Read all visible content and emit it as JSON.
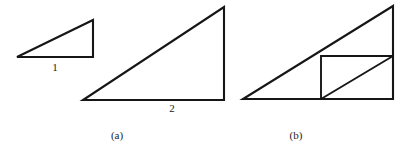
{
  "figure": {
    "width": 408,
    "height": 149,
    "background_color": "#ffffff",
    "stroke_color": "#161616",
    "panels": [
      {
        "id": "panel-a",
        "caption": "(a)",
        "caption_position": {
          "x": 117,
          "y": 135
        },
        "shapes": [
          {
            "id": "small-triangle",
            "type": "right-triangle",
            "points": "17,57 93,57 93,20",
            "description": "small right triangle, base labelled 1"
          },
          {
            "id": "large-triangle",
            "type": "right-triangle",
            "points": "83,100 224,100 224,7",
            "description": "large similar right triangle, base labelled 2"
          }
        ],
        "labels": [
          {
            "id": "label-base-1",
            "text": "1",
            "x": 55,
            "y": 67
          },
          {
            "id": "label-base-2",
            "text": "2",
            "x": 172,
            "y": 108
          }
        ]
      },
      {
        "id": "panel-b",
        "caption": "(b)",
        "caption_position": {
          "x": 296,
          "y": 135
        },
        "shapes": [
          {
            "id": "outer-triangle",
            "type": "right-triangle",
            "points": "243,99 393,99 393,6",
            "description": "large right triangle with inscribed rectangle"
          },
          {
            "id": "inscribed-rectangle",
            "type": "rectangle",
            "points": "321,56 393,56 393,99 321,99",
            "description": "rectangle inscribed in right half of the triangle"
          },
          {
            "id": "rectangle-diagonal",
            "type": "segment",
            "points": "321,99 393,56",
            "description": "diagonal of the inscribed rectangle"
          }
        ],
        "labels": []
      }
    ]
  },
  "chart_data": {
    "type": "diagram",
    "title": "",
    "panels": [
      {
        "caption": "(a)",
        "elements": [
          {
            "name": "small right triangle",
            "base_label": "1",
            "vertices": [
              [
                17,
                57
              ],
              [
                93,
                57
              ],
              [
                93,
                20
              ]
            ]
          },
          {
            "name": "large right triangle",
            "base_label": "2",
            "vertices": [
              [
                83,
                100
              ],
              [
                224,
                100
              ],
              [
                224,
                7
              ]
            ]
          }
        ]
      },
      {
        "caption": "(b)",
        "elements": [
          {
            "name": "outer right triangle",
            "base_label": "",
            "vertices": [
              [
                243,
                99
              ],
              [
                393,
                99
              ],
              [
                393,
                6
              ]
            ]
          },
          {
            "name": "inscribed rectangle",
            "base_label": "",
            "vertices": [
              [
                321,
                56
              ],
              [
                393,
                56
              ],
              [
                393,
                99
              ],
              [
                321,
                99
              ]
            ]
          },
          {
            "name": "rectangle diagonal",
            "base_label": "",
            "vertices": [
              [
                321,
                99
              ],
              [
                393,
                56
              ]
            ]
          }
        ]
      }
    ]
  }
}
